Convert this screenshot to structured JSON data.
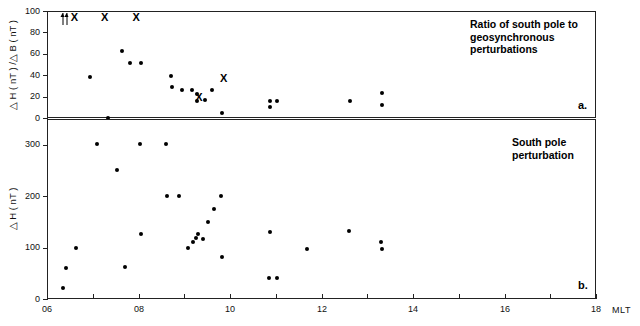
{
  "chart_data": {
    "type": "scatter",
    "title": "",
    "xlabel": "MLT",
    "xlim": [
      6,
      18
    ],
    "xticks": [
      6,
      7,
      8,
      9,
      10,
      11,
      12,
      13,
      14,
      15,
      16,
      17,
      18
    ],
    "xticklabels": [
      "06",
      "",
      "08",
      "",
      "10",
      "",
      "12",
      "",
      "14",
      "",
      "16",
      "",
      "18"
    ],
    "grid": false,
    "legend": "none",
    "panels": [
      {
        "id": "a",
        "letter": "a.",
        "annotation": "Ratio of south pole to\ngeosynchronous\nperturbations",
        "ylabel": "△ H ( nT ) /△ B ( nT )",
        "ylim": [
          0,
          100
        ],
        "yticks": [
          0,
          20,
          40,
          60,
          80,
          100
        ],
        "yticklabels": [
          "0",
          "20",
          "40",
          "60",
          "80",
          "100"
        ],
        "series": [
          {
            "name": "ratio",
            "marker": "filled-circle",
            "points": [
              [
                6.93,
                38
              ],
              [
                7.33,
                0
              ],
              [
                7.63,
                63
              ],
              [
                7.82,
                51
              ],
              [
                8.05,
                51
              ],
              [
                8.72,
                39
              ],
              [
                8.74,
                29
              ],
              [
                8.96,
                26
              ],
              [
                9.17,
                26
              ],
              [
                9.28,
                22
              ],
              [
                9.28,
                16
              ],
              [
                9.45,
                17
              ],
              [
                9.6,
                26
              ],
              [
                9.82,
                5
              ],
              [
                10.88,
                16
              ],
              [
                10.88,
                10
              ],
              [
                11.02,
                16
              ],
              [
                12.62,
                16
              ],
              [
                13.32,
                23
              ],
              [
                13.33,
                12
              ]
            ]
          },
          {
            "name": "off-scale-markers",
            "marker": "x",
            "points": [
              [
                6.6,
                100
              ],
              [
                7.26,
                100
              ],
              [
                7.95,
                100
              ],
              [
                9.32,
                25
              ],
              [
                9.86,
                43
              ]
            ]
          },
          {
            "name": "off-scale-arrows",
            "marker": "up-arrow",
            "points": [
              [
                6.36,
                100
              ],
              [
                6.44,
                100
              ]
            ]
          }
        ]
      },
      {
        "id": "b",
        "letter": "b.",
        "annotation": "South pole\nperturbation",
        "ylabel": "△ H ( nT )",
        "ylim": [
          0,
          350
        ],
        "yticks": [
          0,
          100,
          200,
          300
        ],
        "yticklabels": [
          "0",
          "100",
          "200",
          "300"
        ],
        "series": [
          {
            "name": "deltaH",
            "marker": "filled-circle",
            "points": [
              [
                6.36,
                22
              ],
              [
                6.42,
                60
              ],
              [
                6.64,
                100
              ],
              [
                7.1,
                301
              ],
              [
                7.53,
                250
              ],
              [
                7.7,
                62
              ],
              [
                8.03,
                301
              ],
              [
                8.05,
                126
              ],
              [
                8.6,
                301
              ],
              [
                8.62,
                201
              ],
              [
                8.88,
                201
              ],
              [
                9.08,
                100
              ],
              [
                9.2,
                110
              ],
              [
                9.26,
                118
              ],
              [
                9.3,
                127
              ],
              [
                9.4,
                117
              ],
              [
                9.52,
                150
              ],
              [
                9.64,
                175
              ],
              [
                9.8,
                200
              ],
              [
                9.82,
                82
              ],
              [
                10.86,
                40
              ],
              [
                11.02,
                40
              ],
              [
                10.88,
                131
              ],
              [
                11.68,
                97
              ],
              [
                12.6,
                133
              ],
              [
                13.3,
                110
              ],
              [
                13.32,
                97
              ]
            ]
          }
        ]
      }
    ]
  },
  "figure": {
    "mlt_label": "MLT"
  }
}
